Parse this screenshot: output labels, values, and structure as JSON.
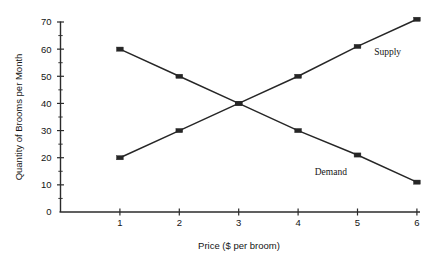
{
  "chart_data": {
    "type": "line",
    "title": "",
    "subtitle": "",
    "xlabel": "Price ($ per broom)",
    "ylabel": "Quantity of Brooms per Month",
    "x": [
      1,
      2,
      3,
      4,
      5,
      6
    ],
    "xlim": [
      0,
      6.6
    ],
    "ylim": [
      0,
      70
    ],
    "xticks": [
      "1",
      "2",
      "3",
      "4",
      "5",
      "6"
    ],
    "yticks": [
      "0",
      "10",
      "20",
      "30",
      "40",
      "50",
      "60",
      "70"
    ],
    "ytick_values": [
      0,
      10,
      20,
      30,
      40,
      50,
      60,
      70
    ],
    "yminor_values": [
      5,
      15,
      25,
      35,
      45,
      55,
      65
    ],
    "grid": false,
    "legend_position": "inline-annotation",
    "marker": "square",
    "series": [
      {
        "name": "Supply",
        "values": [
          20,
          30,
          40,
          50,
          61,
          71
        ],
        "color": "#262626",
        "label_x": 5.28,
        "label_y": 58
      },
      {
        "name": "Demand",
        "values": [
          60,
          50,
          40,
          30,
          21,
          11
        ],
        "color": "#262626",
        "label_x": 4.28,
        "label_y": 13.5
      }
    ],
    "annotations": [
      {
        "text": "Supply",
        "note": "label on upper-right of rising line"
      },
      {
        "text": "Demand",
        "note": "label on lower-right of falling line"
      }
    ],
    "equilibrium": {
      "price": 3,
      "quantity": 40
    }
  }
}
